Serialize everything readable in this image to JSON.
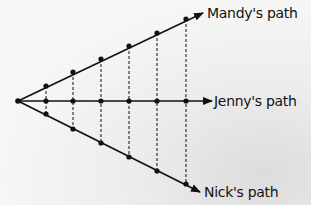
{
  "diagram": {
    "origin": {
      "x": 18,
      "y": 101
    },
    "paths": [
      {
        "id": "mandy",
        "label": "Mandy's path",
        "arrow_tip": {
          "x": 203,
          "y": 13
        },
        "points": [
          [
            46,
            86
          ],
          [
            73,
            72
          ],
          [
            101,
            59
          ],
          [
            129,
            46
          ],
          [
            157,
            33
          ],
          [
            186,
            19
          ]
        ],
        "label_pos": {
          "x": 207,
          "y": 6
        }
      },
      {
        "id": "jenny",
        "label": "Jenny's path",
        "arrow_tip": {
          "x": 212,
          "y": 101
        },
        "points": [
          [
            46,
            101
          ],
          [
            73,
            101
          ],
          [
            101,
            101
          ],
          [
            129,
            101
          ],
          [
            157,
            101
          ],
          [
            186,
            101
          ]
        ],
        "label_pos": {
          "x": 214,
          "y": 94
        }
      },
      {
        "id": "nick",
        "label": "Nick's path",
        "arrow_tip": {
          "x": 200,
          "y": 192
        },
        "points": [
          [
            46,
            114
          ],
          [
            73,
            129
          ],
          [
            101,
            143
          ],
          [
            129,
            157
          ],
          [
            157,
            171
          ],
          [
            186,
            184
          ]
        ],
        "label_pos": {
          "x": 204,
          "y": 185
        }
      }
    ],
    "dashed_columns_x": [
      46,
      73,
      101,
      129,
      157,
      186
    ],
    "colors": {
      "line": "#111111",
      "background": "#f4f4f2"
    }
  }
}
